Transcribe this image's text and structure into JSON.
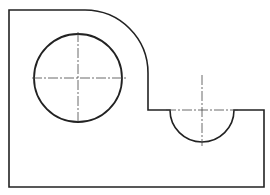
{
  "drawing": {
    "type": "orthographic-view",
    "line_color": "#222222",
    "centerline_color": "#444444",
    "outline": {
      "left": 9,
      "top": 10,
      "right": 264,
      "bottom": 187,
      "arc_start_x": 85,
      "arc_radius": 63,
      "step_x": 148,
      "step_y": 110
    },
    "hole": {
      "cx": 78,
      "cy": 78,
      "r": 44
    },
    "notch": {
      "cx": 202,
      "cy": 110,
      "r": 32
    }
  }
}
